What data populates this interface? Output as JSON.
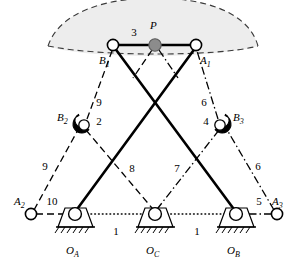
{
  "figure": {
    "background_color": "#ffffff",
    "workspace_fill": "#ededed",
    "line_color": "#000000",
    "platform_point_fill": "#8c8c8c"
  },
  "joints": {
    "B1": {
      "label": "B",
      "subscript": "1",
      "x": 113,
      "y": 45,
      "type": "revolute-open-circle"
    },
    "A1": {
      "label": "A",
      "subscript": "1",
      "x": 196,
      "y": 45,
      "type": "revolute-open-circle"
    },
    "P": {
      "label": "P",
      "subscript": "",
      "x": 155,
      "y": 45,
      "type": "platform-reference-point"
    },
    "B2": {
      "label": "B",
      "subscript": "2",
      "x": 82,
      "y": 124,
      "type": "clamped-revolute-right"
    },
    "B3": {
      "label": "B",
      "subscript": "3",
      "x": 222,
      "y": 124,
      "type": "clamped-revolute-left"
    },
    "A2": {
      "label": "A",
      "subscript": "2",
      "x": 31,
      "y": 214,
      "type": "revolute-open-circle"
    },
    "A3": {
      "label": "A",
      "subscript": "3",
      "x": 277,
      "y": 214,
      "type": "revolute-open-circle"
    },
    "OA": {
      "label": "O",
      "subscript": "A",
      "x": 75,
      "y": 214,
      "type": "grounded-pivot"
    },
    "OC": {
      "label": "O",
      "subscript": "C",
      "x": 155,
      "y": 214,
      "type": "grounded-pivot"
    },
    "OB": {
      "label": "O",
      "subscript": "B",
      "x": 236,
      "y": 214,
      "type": "grounded-pivot"
    }
  },
  "link_numbers": {
    "n1_left": {
      "text": "1",
      "x": 116,
      "y": 235
    },
    "n1_right": {
      "text": "1",
      "x": 197,
      "y": 235
    },
    "n2": {
      "text": "2",
      "x": 99,
      "y": 125
    },
    "n3": {
      "text": "3",
      "x": 134,
      "y": 36
    },
    "n4": {
      "text": "4",
      "x": 204,
      "y": 125
    },
    "n5": {
      "text": "5",
      "x": 259,
      "y": 205
    },
    "n6_upper": {
      "text": "6",
      "x": 204,
      "y": 106
    },
    "n6_lower": {
      "text": "6",
      "x": 258,
      "y": 170
    },
    "n7": {
      "text": "7",
      "x": 177,
      "y": 172
    },
    "n8": {
      "text": "8",
      "x": 132,
      "y": 172
    },
    "n9_upper": {
      "text": "9",
      "x": 100,
      "y": 106
    },
    "n9_lower": {
      "text": "9",
      "x": 45,
      "y": 170
    },
    "n10": {
      "text": "10",
      "x": 50,
      "y": 205
    }
  },
  "links": [
    {
      "name": "platform-B1-A1",
      "number": "3",
      "style": "solid-thick",
      "from": "B1",
      "to": "A1"
    },
    {
      "name": "crank-OA-A1",
      "number": "2",
      "style": "solid-thick",
      "from": "OA",
      "to": "A1"
    },
    {
      "name": "crank-OB-B1",
      "number": "4",
      "style": "solid-thick",
      "from": "OB",
      "to": "B1"
    },
    {
      "name": "ground-OA-OC-OB",
      "number": "1",
      "style": "dotted",
      "from": "OA",
      "to": "OB"
    },
    {
      "name": "coupler-B1-B2",
      "number": "9",
      "style": "dashed",
      "from": "B1",
      "to": "B2"
    },
    {
      "name": "coupler-B2-A2",
      "number": "9",
      "style": "dashed",
      "from": "B2",
      "to": "A2"
    },
    {
      "name": "coupler-P-OC",
      "number": "8",
      "style": "dashed",
      "from": "P",
      "to": "OC"
    },
    {
      "name": "coupler-A2-OA",
      "number": "10",
      "style": "dashed",
      "from": "A2",
      "to": "OA"
    },
    {
      "name": "coupler-A1-B3",
      "number": "6",
      "style": "dash-dot",
      "from": "A1",
      "to": "B3"
    },
    {
      "name": "coupler-B3-A3",
      "number": "6",
      "style": "dash-dot",
      "from": "B3",
      "to": "A3"
    },
    {
      "name": "coupler-P-OC-r",
      "number": "7",
      "style": "dash-dot",
      "from": "P",
      "to": "OC"
    },
    {
      "name": "coupler-A3-OB",
      "number": "5",
      "style": "dash-dot",
      "from": "A3",
      "to": "OB"
    }
  ],
  "workspace_region": {
    "name": "workspace-envelope",
    "style": "dashed-outline-shaded-lens"
  }
}
